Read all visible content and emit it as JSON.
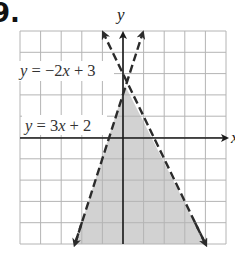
{
  "problem": {
    "number": "9."
  },
  "graph": {
    "x_axis_label": "x",
    "y_axis_label": "y",
    "x_range": [
      -5,
      5
    ],
    "y_range": [
      -5,
      5
    ],
    "grid": true,
    "grid_step": 1,
    "shade_color": "#d2d2d2",
    "grid_color": "#b4b4b4",
    "axis_color": "#1a1a1a",
    "line_color": "#2b2b2b"
  },
  "lines": [
    {
      "id": "line-a",
      "label": "y = −2x + 3",
      "label_parts": [
        "y",
        " = −2",
        "x",
        " + 3"
      ],
      "slope": -2,
      "intercept": 3,
      "style": "dashed"
    },
    {
      "id": "line-b",
      "label": "y = 3x + 2",
      "label_parts": [
        "y",
        " = 3",
        "x",
        " + 2"
      ],
      "slope": 3,
      "intercept": 2,
      "style": "dashed"
    }
  ],
  "shaded_region": {
    "description": "y < -2x + 3 and y < 3x + 2",
    "vertex": [
      0.2,
      2.6
    ]
  }
}
